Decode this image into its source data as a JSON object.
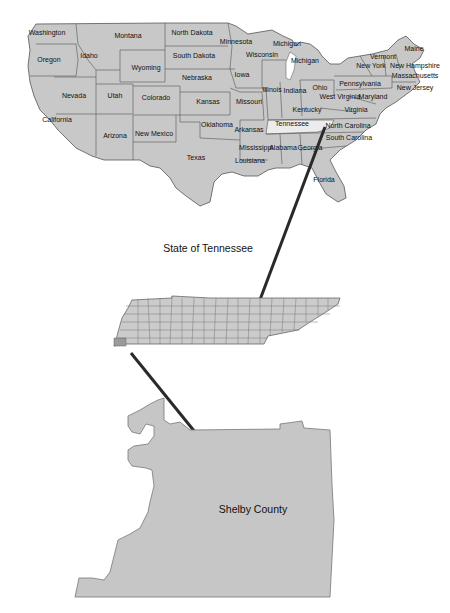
{
  "colors": {
    "state_fill": "#c8c8c8",
    "state_stroke": "#555555",
    "highlight_fill": "#ececec",
    "county_fill": "#c6c6c6",
    "arrow": "#2a2a2a",
    "background": "#ffffff"
  },
  "us_map": {
    "states": [
      {
        "name": "Washington",
        "x": 47,
        "y": 35
      },
      {
        "name": "Montana",
        "x": 128,
        "y": 38
      },
      {
        "name": "North Dakota",
        "x": 192,
        "y": 35
      },
      {
        "name": "Minnesota",
        "x": 236,
        "y": 44
      },
      {
        "name": "Michigan",
        "x": 287,
        "y": 46
      },
      {
        "name": "Maine",
        "x": 414,
        "y": 51
      },
      {
        "name": "Vermont",
        "x": 383,
        "y": 59
      },
      {
        "name": "Wisconsin",
        "x": 262,
        "y": 57
      },
      {
        "name": "Oregon",
        "x": 49,
        "y": 62
      },
      {
        "name": "Idaho",
        "x": 89,
        "y": 58
      },
      {
        "name": "South Dakota",
        "x": 194,
        "y": 58
      },
      {
        "name": "Michigan",
        "x": 305,
        "y": 63
      },
      {
        "name": "New York",
        "x": 371,
        "y": 68
      },
      {
        "name": "New Hampshire",
        "x": 415,
        "y": 68
      },
      {
        "name": "Wyoming",
        "x": 146,
        "y": 70
      },
      {
        "name": "Massachusetts",
        "x": 415,
        "y": 78
      },
      {
        "name": "Iowa",
        "x": 242,
        "y": 77
      },
      {
        "name": "Nebraska",
        "x": 197,
        "y": 80
      },
      {
        "name": "Pennsylvania",
        "x": 360,
        "y": 86
      },
      {
        "name": "Ohio",
        "x": 320,
        "y": 90
      },
      {
        "name": "New Jersey",
        "x": 415,
        "y": 90
      },
      {
        "name": "Illinois",
        "x": 272,
        "y": 92
      },
      {
        "name": "Indiana",
        "x": 295,
        "y": 93
      },
      {
        "name": "Nevada",
        "x": 74,
        "y": 98
      },
      {
        "name": "Utah",
        "x": 115,
        "y": 98
      },
      {
        "name": "Colorado",
        "x": 156,
        "y": 100
      },
      {
        "name": "West Virginia",
        "x": 340,
        "y": 99
      },
      {
        "name": "Maryland",
        "x": 373,
        "y": 99
      },
      {
        "name": "Missouri",
        "x": 249,
        "y": 104
      },
      {
        "name": "Kansas",
        "x": 208,
        "y": 104
      },
      {
        "name": "Kentucky",
        "x": 307,
        "y": 112
      },
      {
        "name": "Virginia",
        "x": 356,
        "y": 112
      },
      {
        "name": "California",
        "x": 57,
        "y": 122
      },
      {
        "name": "Tennessee",
        "x": 292,
        "y": 126
      },
      {
        "name": "North Carolina",
        "x": 348,
        "y": 128
      },
      {
        "name": "Oklahoma",
        "x": 217,
        "y": 127
      },
      {
        "name": "Arkansas",
        "x": 249,
        "y": 132
      },
      {
        "name": "Arizona",
        "x": 115,
        "y": 138
      },
      {
        "name": "New Mexico",
        "x": 154,
        "y": 136
      },
      {
        "name": "South Carolina",
        "x": 349,
        "y": 140
      },
      {
        "name": "Mississippi",
        "x": 256,
        "y": 150
      },
      {
        "name": "Alabama",
        "x": 283,
        "y": 150
      },
      {
        "name": "Georgia",
        "x": 310,
        "y": 150
      },
      {
        "name": "Texas",
        "x": 196,
        "y": 160
      },
      {
        "name": "Louisiana",
        "x": 250,
        "y": 163
      },
      {
        "name": "Florida",
        "x": 324,
        "y": 182
      }
    ],
    "highlighted_state": "Tennessee"
  },
  "tennessee": {
    "title": "State of Tennessee",
    "highlighted_county": "Shelby"
  },
  "shelby": {
    "label": "Shelby County"
  }
}
